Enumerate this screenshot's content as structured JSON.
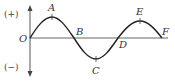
{
  "diagram": {
    "type": "wave-graph",
    "axis_labels": {
      "positive": "(+)",
      "negative": "(−)",
      "origin": "O"
    },
    "points": [
      {
        "id": "O",
        "label": "O",
        "x": 30,
        "y": 38,
        "role": "origin"
      },
      {
        "id": "A",
        "label": "A",
        "x": 52,
        "y": 17,
        "role": "crest"
      },
      {
        "id": "B",
        "label": "B",
        "x": 74,
        "y": 38,
        "role": "zero-crossing"
      },
      {
        "id": "C",
        "label": "C",
        "x": 96,
        "y": 59,
        "role": "trough"
      },
      {
        "id": "D",
        "label": "D",
        "x": 118,
        "y": 38,
        "role": "zero-crossing"
      },
      {
        "id": "E",
        "label": "E",
        "x": 140,
        "y": 21,
        "role": "crest"
      },
      {
        "id": "F",
        "label": "F",
        "x": 162,
        "y": 38,
        "role": "end-point"
      }
    ],
    "colors": {
      "curve": "#222222",
      "axis": "#555555",
      "text": "#333333"
    }
  }
}
